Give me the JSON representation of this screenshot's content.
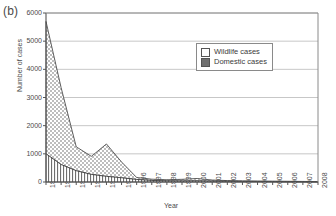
{
  "panel": {
    "label": "(b)"
  },
  "legend": {
    "position": "upper-right",
    "entries": [
      {
        "label": "Wildlife cases",
        "pattern": "dotted",
        "swatch_name": "wildlife-swatch"
      },
      {
        "label": "Domestic cases",
        "pattern": "solid-dark",
        "swatch_name": "domestic-swatch"
      }
    ]
  },
  "chart_data": {
    "type": "area",
    "stacked": true,
    "title": "",
    "xlabel": "Year",
    "ylabel": "Number of cases",
    "xlim": [
      1990,
      2008
    ],
    "ylim": [
      0,
      6000
    ],
    "yticks": [
      0,
      1000,
      2000,
      3000,
      4000,
      5000,
      6000
    ],
    "grid": "horizontal",
    "categories": [
      1990,
      1991,
      1992,
      1993,
      1994,
      1995,
      1996,
      1997,
      1998,
      1999,
      2000,
      2001,
      2002,
      2003,
      2004,
      2005,
      2006,
      2007,
      2008
    ],
    "x": [
      "1990",
      "1991",
      "1992",
      "1993",
      "1994",
      "1995",
      "1996",
      "1997",
      "1998",
      "1999",
      "2000",
      "2001",
      "2002",
      "2003",
      "2004",
      "2005",
      "2006",
      "2007",
      "2008"
    ],
    "series": [
      {
        "name": "Domestic cases",
        "pattern": "solid-dark",
        "values": [
          1000,
          620,
          400,
          270,
          200,
          150,
          90,
          55,
          40,
          35,
          40,
          30,
          25,
          20,
          18,
          15,
          12,
          10,
          8
        ]
      },
      {
        "name": "Wildlife cases",
        "pattern": "dotted",
        "values": [
          4700,
          2730,
          850,
          640,
          1150,
          560,
          70,
          45,
          40,
          60,
          85,
          40,
          25,
          20,
          17,
          15,
          13,
          10,
          8
        ]
      }
    ],
    "totals": [
      5700,
      3350,
      1250,
      910,
      1350,
      710,
      160,
      100,
      80,
      95,
      125,
      70,
      50,
      40,
      35,
      30,
      25,
      20,
      16
    ]
  }
}
